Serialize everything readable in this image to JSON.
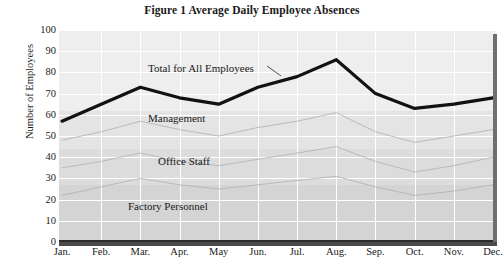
{
  "chart_data": {
    "type": "area",
    "title": "Figure 1  Average Daily Employee Absences",
    "xlabel": "",
    "ylabel": "Number of Employees",
    "ylim": [
      0,
      100
    ],
    "ytick_step": 10,
    "grid": true,
    "legend_position": "inline-annotations",
    "categories": [
      "Jan.",
      "Feb.",
      "Mar.",
      "Apr.",
      "May",
      "Jun.",
      "Jul.",
      "Aug.",
      "Sep.",
      "Oct.",
      "Nov.",
      "Dec."
    ],
    "yticks": [
      "0",
      "10",
      "20",
      "30",
      "40",
      "50",
      "60",
      "70",
      "80",
      "90",
      "100"
    ],
    "series": [
      {
        "name": "Total for All Employees",
        "style": "thick-black-line",
        "values": [
          57,
          65,
          73,
          68,
          65,
          73,
          78,
          86,
          70,
          63,
          65,
          68
        ]
      },
      {
        "name": "Management",
        "style": "faint-grey-line",
        "values": [
          48,
          52,
          57,
          53,
          50,
          54,
          57,
          61,
          52,
          47,
          50,
          53
        ]
      },
      {
        "name": "Office Staff",
        "style": "faint-grey-line",
        "values": [
          35,
          38,
          42,
          38,
          36,
          39,
          42,
          45,
          38,
          33,
          36,
          40
        ]
      },
      {
        "name": "Factory Personnel",
        "style": "faint-grey-line",
        "values": [
          22,
          26,
          30,
          27,
          25,
          27,
          29,
          31,
          26,
          22,
          24,
          27
        ]
      }
    ],
    "annotations": [
      {
        "text": "Total for All Employees",
        "x_px": 148,
        "y_px": 62
      },
      {
        "text": "Management",
        "x_px": 148,
        "y_px": 112
      },
      {
        "text": "Office Staff",
        "x_px": 158,
        "y_px": 155
      },
      {
        "text": "Factory Personnel",
        "x_px": 128,
        "y_px": 200
      }
    ],
    "colors": {
      "plot_background": "#e9e9e9",
      "gridline": "#ffffff",
      "total_line": "#121212",
      "faint_series_line": "#b3b3b3",
      "axis": "#2b2b2b",
      "shadow": "#6f6f6f",
      "text": "#191919"
    }
  }
}
